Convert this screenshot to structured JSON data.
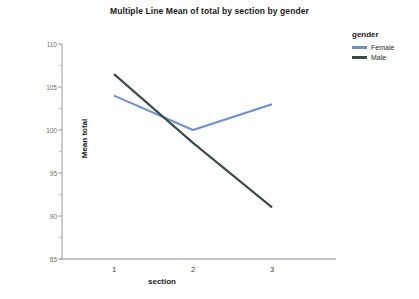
{
  "chart_data": {
    "type": "line",
    "title": "Multiple Line Mean of total by section by gender",
    "xlabel": "section",
    "ylabel": "Mean total",
    "categories": [
      "1",
      "2",
      "3"
    ],
    "x": [
      1,
      2,
      3
    ],
    "ylim": [
      85,
      110
    ],
    "yticks": [
      85,
      90,
      95,
      100,
      105,
      110
    ],
    "ytick_labels": [
      "85",
      "90",
      "95",
      "100",
      "105",
      "110"
    ],
    "yminor_step": 2.5,
    "grid": false,
    "legend_position": "right",
    "legend_title": "gender",
    "series": [
      {
        "name": "Female",
        "color": "#6b93c9",
        "values": [
          104.0,
          100.0,
          103.0
        ]
      },
      {
        "name": "Male",
        "color": "#3a4a4a",
        "values": [
          106.5,
          98.5,
          91.0
        ]
      }
    ]
  }
}
